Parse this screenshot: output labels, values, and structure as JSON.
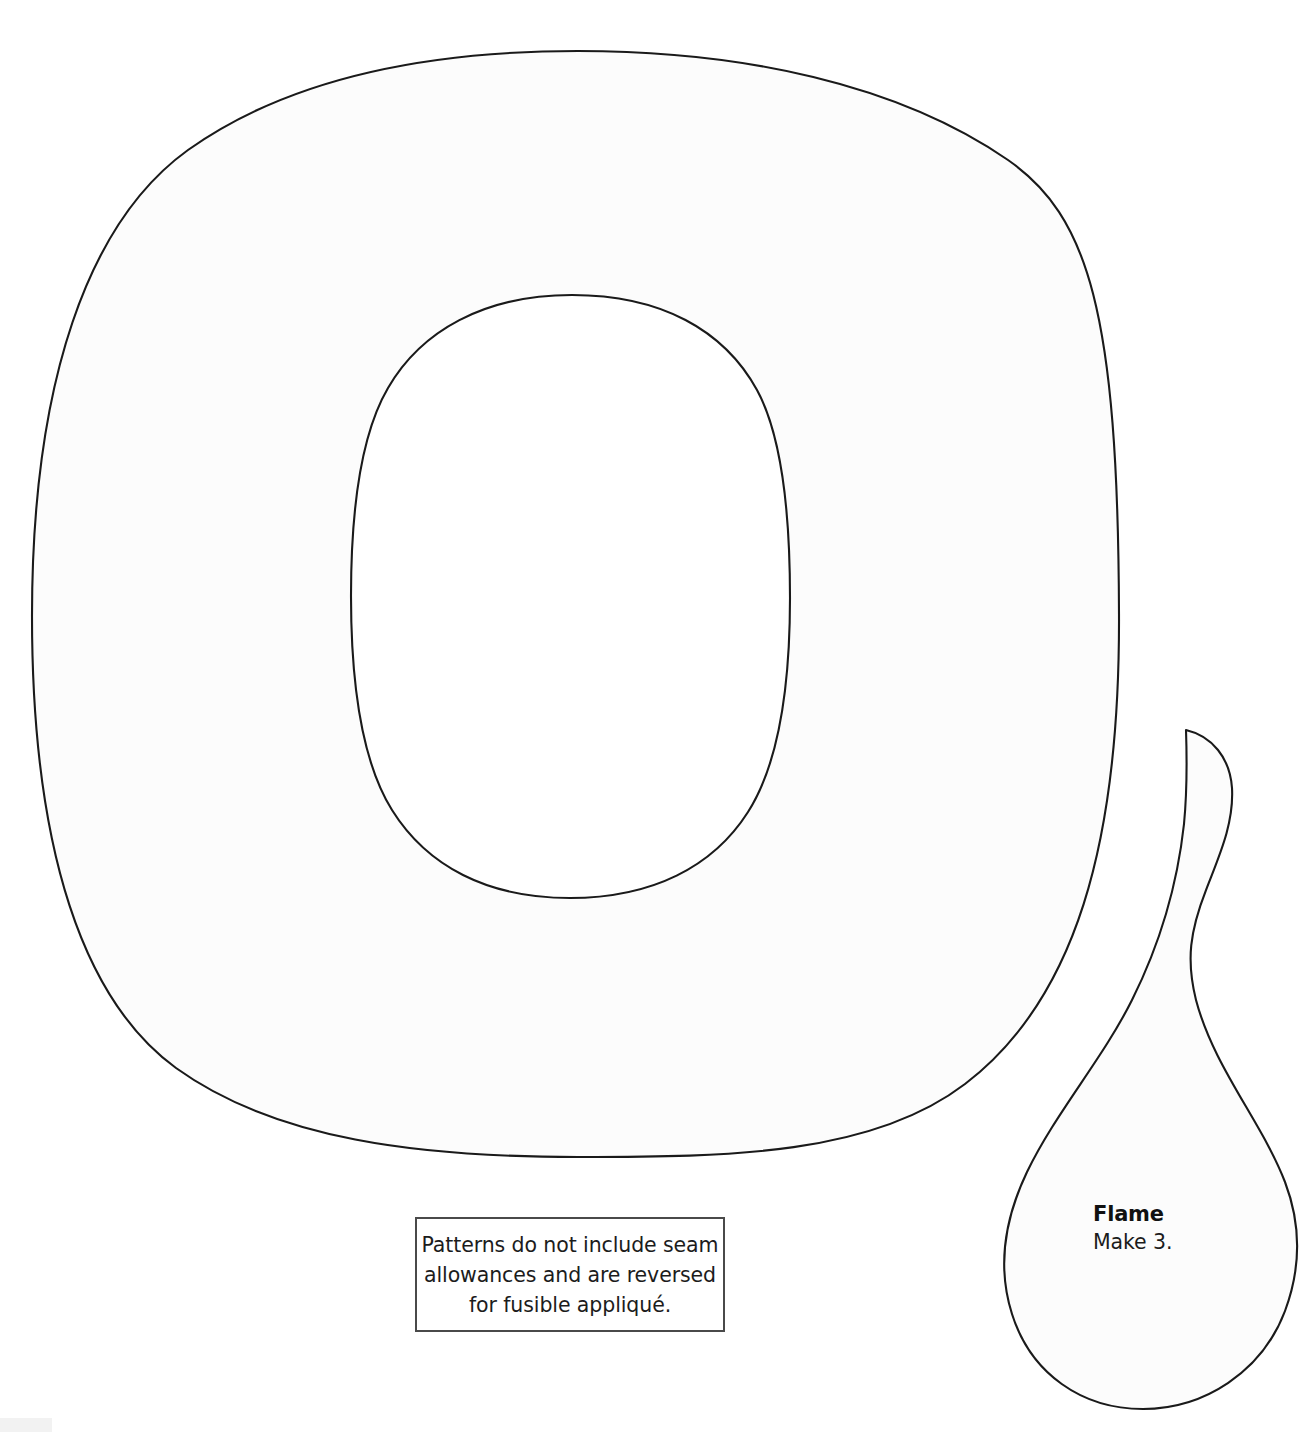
{
  "document": {
    "type": "appliqué pattern template sheet",
    "background_color": "#ffffff",
    "ink_color": "#1a1a1a",
    "piece_fill_color": "#fcfcfc"
  },
  "pieces": [
    {
      "id": "ring-o",
      "name": "O ring shape",
      "label": "",
      "description": "Large letter-O / ring shaped pattern piece with oval cutout"
    },
    {
      "id": "flame",
      "name": "Flame",
      "label": "Flame",
      "quantity_note": "Make 3.",
      "description": "Teardrop shaped flame piece with curled tip"
    }
  ],
  "flame_label": {
    "title": "Flame",
    "subtitle": "Make 3."
  },
  "note_box": {
    "border_color": "#4a4a4a",
    "lines": [
      "Patterns do not include seam",
      "allowances and are reversed",
      "for fusible appliqué."
    ]
  }
}
